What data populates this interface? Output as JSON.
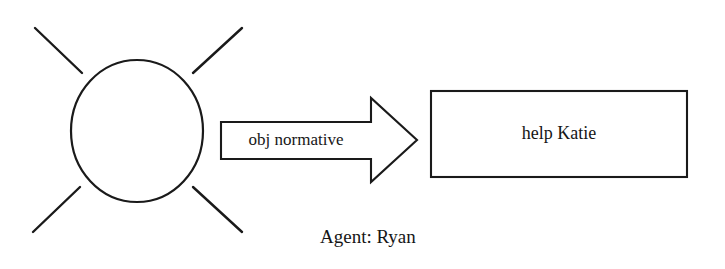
{
  "diagram": {
    "type": "semantic-network-diagram",
    "background_color": "#ffffff",
    "stroke_color": "#1a1a1a",
    "text_color": "#161616",
    "agent_node": {
      "shape": "ellipse",
      "label": "",
      "ray_count": 4
    },
    "agent_caption": "Agent: Ryan",
    "relation_arrow": {
      "label": "obj normative",
      "direction": "right"
    },
    "target_box": {
      "label": "help Katie",
      "shape": "rectangle"
    }
  }
}
